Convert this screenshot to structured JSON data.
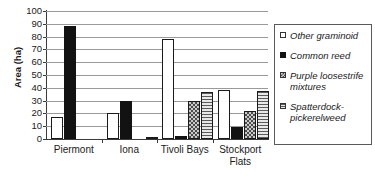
{
  "chart_data": {
    "type": "bar",
    "title": "",
    "xlabel": "",
    "ylabel": "Area (ha)",
    "ylim": [
      0,
      100
    ],
    "yticks": [
      0,
      10,
      20,
      30,
      40,
      50,
      60,
      70,
      80,
      90,
      100
    ],
    "grid": true,
    "legend_position": "right",
    "categories": [
      "Piermont",
      "Iona",
      "Tivoli Bays",
      "Stockport Flats"
    ],
    "series": [
      {
        "name": "Other graminoid",
        "pattern": "open-white",
        "values": [
          17.5,
          20.5,
          78,
          38
        ]
      },
      {
        "name": "Common reed",
        "pattern": "solid-black",
        "values": [
          88,
          30,
          2,
          9
        ]
      },
      {
        "name": "Purple loosestrife mixtures",
        "pattern": "checkered-gray",
        "values": [
          0,
          0,
          30,
          22
        ]
      },
      {
        "name": "Spatterdock-pickerelweed",
        "pattern": "horizontal-lines-gray",
        "values": [
          0,
          1,
          37,
          37.5
        ]
      }
    ]
  },
  "axis": {
    "y_title": "Area (ha)",
    "y_tick_labels": [
      "100",
      "90",
      "80",
      "70",
      "60",
      "50",
      "40",
      "30",
      "20",
      "10",
      "0"
    ],
    "x_tick_labels": [
      {
        "line1": "Piermont",
        "line2": ""
      },
      {
        "line1": "Iona",
        "line2": ""
      },
      {
        "line1": "Tivoli Bays",
        "line2": ""
      },
      {
        "line1": "Stockport",
        "line2": "Flats"
      }
    ]
  },
  "legend": {
    "items": [
      {
        "label": "Other graminoid",
        "swatch": "open-white-swatch"
      },
      {
        "label": "Common reed",
        "swatch": "solid-black-swatch"
      },
      {
        "label": "Purple loosestrife mixtures",
        "swatch": "checkered-gray-swatch"
      },
      {
        "label": "Spatterdock-pickerelweed",
        "swatch": "horizontal-lines-gray-swatch"
      }
    ]
  },
  "colors": {
    "series_1": "#ffffff",
    "series_2": "#121212",
    "series_3": "#c9c9c9",
    "series_4": "#d2d2d2",
    "axis": "#3a3a3a",
    "gridline": "#9a9a9a",
    "text": "#1a1a1a"
  }
}
